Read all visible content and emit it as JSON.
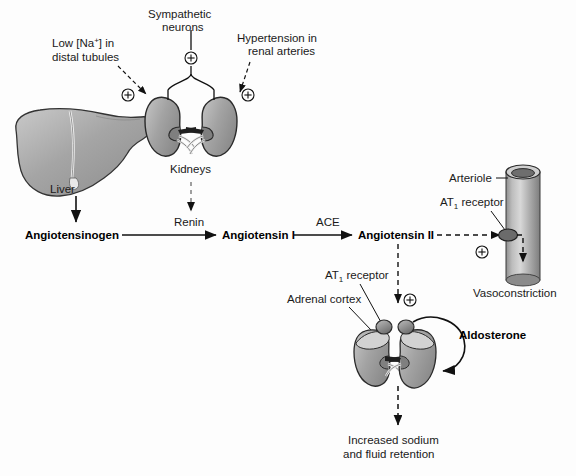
{
  "diagram": {
    "background_color": "#fdfdfd",
    "ink_color": "#1a1a1a",
    "organ_fill": "#9d9d9d",
    "organ_fill_light": "#c4c4c4",
    "organ_stroke": "#2a2a2a"
  },
  "stimuli": {
    "low_sodium": {
      "line1": "Low [Na",
      "sup": "+",
      "line1_end": "] in",
      "line2": "distal tubules"
    },
    "sympathetic": {
      "line1": "Sympathetic",
      "line2": "neurons"
    },
    "hypertension": {
      "line1": "Hypertension in",
      "line2": "renal arteries"
    }
  },
  "organs": {
    "liver_label": "Liver",
    "kidneys_label": "Kidneys",
    "arteriole_label": "Arteriole",
    "adrenal_cortex_label": "Adrenal cortex"
  },
  "pathway": {
    "angiotensinogen": "Angiotensinogen",
    "renin": "Renin",
    "angiotensin_1": "Angiotensin I",
    "ace": "ACE",
    "angiotensin_2": "Angiotensin II"
  },
  "receptors": {
    "at1_top": {
      "prefix": "AT",
      "sub": "1",
      "suffix": " receptor"
    },
    "at1_bottom": {
      "prefix": "AT",
      "sub": "1",
      "suffix": " receptor"
    }
  },
  "effects": {
    "vasoconstriction": "Vasoconstriction",
    "aldosterone": "Aldosterone",
    "retention_line1": "Increased sodium",
    "retention_line2": "and fluid retention"
  },
  "symbols": {
    "plus_circle": "⊕",
    "plus_count": 5
  }
}
